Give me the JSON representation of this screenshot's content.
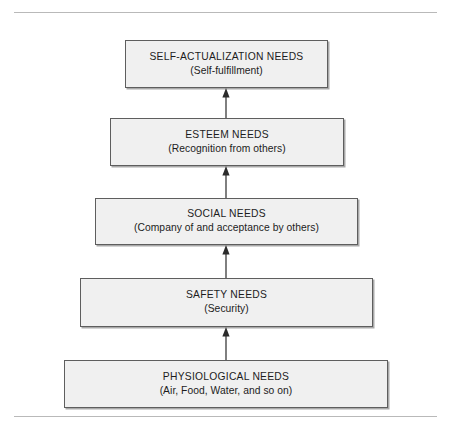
{
  "figure": {
    "name": "maslow-hierarchy-of-needs-diagram",
    "colors": {
      "box_fill": "#f0f0f0",
      "box_border": "#5e5e5e",
      "rule": "#b9b9b9",
      "text": "#1c1c1c",
      "arrow": "#2b2b2b",
      "background": "#ffffff"
    },
    "rules": {
      "top_label": "top-divider-rule",
      "bottom_label": "bottom-divider-rule"
    },
    "levels": [
      {
        "id": "self-actualization",
        "title": "SELF-ACTUALIZATION NEEDS",
        "subtitle": "(Self-fulfillment)"
      },
      {
        "id": "esteem",
        "title": "ESTEEM NEEDS",
        "subtitle": "(Recognition from others)"
      },
      {
        "id": "social",
        "title": "SOCIAL NEEDS",
        "subtitle": "(Company of and acceptance by others)"
      },
      {
        "id": "safety",
        "title": "SAFETY NEEDS",
        "subtitle": "(Security)"
      },
      {
        "id": "physiological",
        "title": "PHYSIOLOGICAL NEEDS",
        "subtitle": "(Air, Food, Water, and so on)"
      }
    ],
    "arrows": [
      {
        "id": "arrow-physiological-to-safety",
        "icon": "arrow-up-icon",
        "direction": "up"
      },
      {
        "id": "arrow-safety-to-social",
        "icon": "arrow-up-icon",
        "direction": "up"
      },
      {
        "id": "arrow-social-to-esteem",
        "icon": "arrow-up-icon",
        "direction": "up"
      },
      {
        "id": "arrow-esteem-to-self-actualization",
        "icon": "arrow-up-icon",
        "direction": "up"
      }
    ]
  }
}
